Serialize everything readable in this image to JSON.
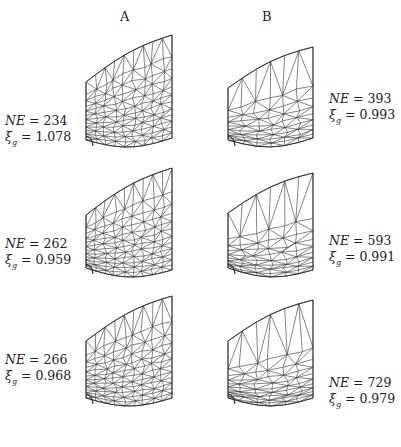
{
  "figure": {
    "columns": [
      {
        "id": "A",
        "header": "A"
      },
      {
        "id": "B",
        "header": "B"
      }
    ],
    "panels": [
      {
        "column": "A",
        "row": 1,
        "NE_label": "NE = 234",
        "xi_label": "ξg = 1.078",
        "NE": 234,
        "xi_g": 1.078
      },
      {
        "column": "A",
        "row": 2,
        "NE_label": "NE = 262",
        "xi_label": "ξg = 0.959",
        "NE": 262,
        "xi_g": 0.959
      },
      {
        "column": "A",
        "row": 3,
        "NE_label": "NE = 266",
        "xi_label": "ξg = 0.968",
        "NE": 266,
        "xi_g": 0.968
      },
      {
        "column": "B",
        "row": 1,
        "NE_label": "NE = 393",
        "xi_label": "ξg = 0.993",
        "NE": 393,
        "xi_g": 0.993
      },
      {
        "column": "B",
        "row": 2,
        "NE_label": "NE = 593",
        "xi_label": "ξg = 0.991",
        "NE": 593,
        "xi_g": 0.991
      },
      {
        "column": "B",
        "row": 3,
        "NE_label": "NE = 729",
        "xi_label": "ξg = 0.979",
        "NE": 729,
        "xi_g": 0.979
      }
    ],
    "text": {
      "ne_prefix": "NE",
      "xi_symbol": "ξ",
      "xi_sub": "g",
      "eq": " = "
    }
  }
}
